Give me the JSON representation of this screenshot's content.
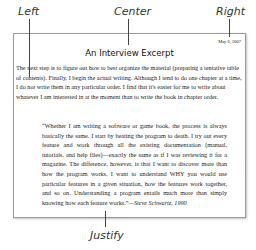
{
  "callouts": {
    "left": "Left",
    "center": "Center",
    "right": "Right",
    "justify": "Justify"
  },
  "document": {
    "date": "May 6, 2007",
    "title": "An Interview Excerpt",
    "paragraph": "The next step is to figure out how to best organize the material (preparing a tentative table of contents). Finally, I begin the actual writing. Although I tend to do one chapter at a time, I do not write them in any particular order. I find that it's easier for me to write about whatever I am interested in at the moment than to write the book in chapter order.",
    "quote": "“Whether I am writing a software or game book, the process is always basically the same. I start by beating the program to death. I try out every feature and work through all the existing documentation (manual, tutorials, and help files)—exactly the same as if I was reviewing it for a magazine. The difference, however, is that I want to discover more than how the program works. I want to understand WHY you would use particular features in a given situation, how the features work together, and so on. Understanding a program entails much more than simply knowing how each feature works.”",
    "citation": "—Steve Schwartz, 1990"
  }
}
